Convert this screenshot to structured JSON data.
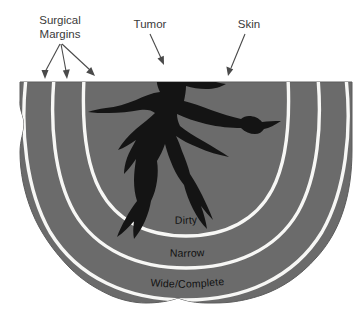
{
  "figure": {
    "background_color": "#ffffff",
    "tissue_color": "#6b6b6b",
    "tissue_edge_color": "#5f5f5f",
    "tumor_color": "#141414",
    "margin_line_color": "#f7f7f5",
    "leader_color": "#4a4a4a",
    "label_text_color": "#3a3a3a",
    "arc_label_text_color": "#111111"
  },
  "callouts": [
    {
      "id": "surgical-margins",
      "line1": "Surgical",
      "line2": "Margins",
      "arrow_count": 3
    },
    {
      "id": "tumor",
      "label": "Tumor",
      "arrow_count": 1
    },
    {
      "id": "skin",
      "label": "Skin",
      "arrow_count": 1
    }
  ],
  "margins": [
    {
      "id": "dirty",
      "label": "Dirty",
      "order": 1,
      "description": "innermost margin arc"
    },
    {
      "id": "narrow",
      "label": "Narrow",
      "order": 2,
      "description": "middle margin arc"
    },
    {
      "id": "wide-complete",
      "label": "Wide/Complete",
      "order": 3,
      "description": "outermost margin arc"
    }
  ],
  "anatomy": {
    "skin_label": "Skin",
    "tumor_label": "Tumor",
    "tissue_label": "Tissue block"
  }
}
